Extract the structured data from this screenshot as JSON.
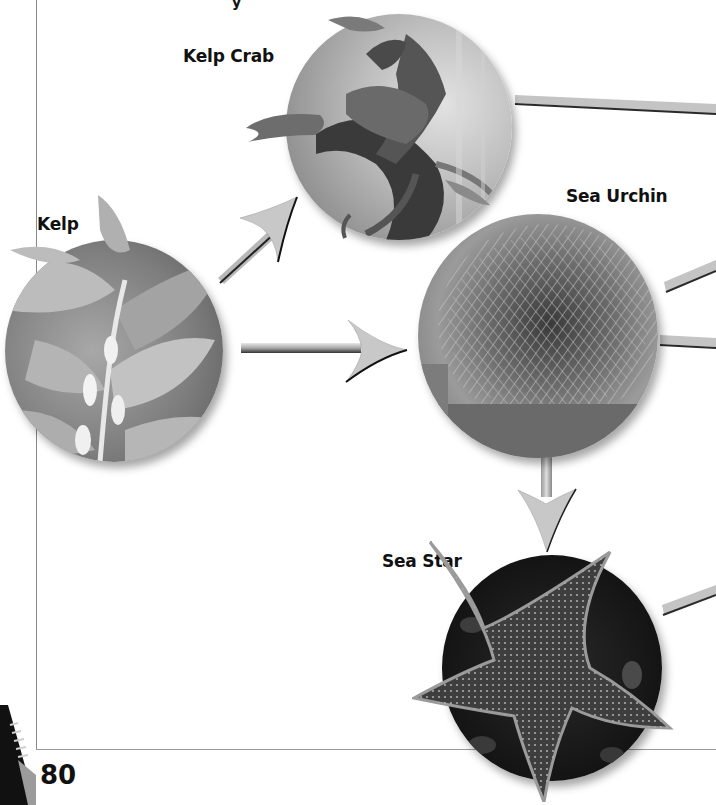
{
  "page": {
    "page_number": "80",
    "background": "#ffffff",
    "frame_color": "#888888"
  },
  "organisms": [
    {
      "id": "kelp",
      "label": "Kelp",
      "image": "kelp-photo"
    },
    {
      "id": "kelp-crab",
      "label": "Kelp Crab",
      "image": "kelp-crab-photo"
    },
    {
      "id": "sea-urchin",
      "label": "Sea Urchin",
      "image": "sea-urchin-photo"
    },
    {
      "id": "sea-star",
      "label": "Sea Star",
      "image": "sea-star-photo"
    }
  ],
  "arrows": [
    {
      "from": "kelp",
      "to": "kelp-crab",
      "direction": "up-right"
    },
    {
      "from": "kelp",
      "to": "sea-urchin",
      "direction": "right"
    },
    {
      "from": "sea-urchin",
      "to": "sea-star",
      "direction": "down"
    }
  ],
  "offpage_connectors": [
    {
      "from": "kelp-crab",
      "direction": "right"
    },
    {
      "from": "sea-urchin",
      "direction": "up-right"
    },
    {
      "from": "sea-urchin",
      "direction": "right"
    },
    {
      "from": "sea-star",
      "direction": "up-right"
    }
  ],
  "top_fragment": "y"
}
